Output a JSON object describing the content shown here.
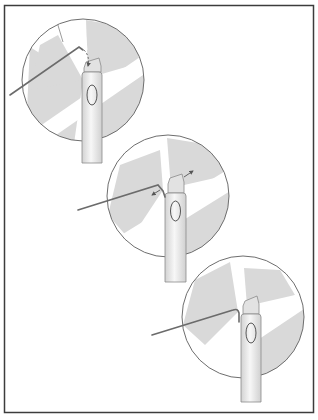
{
  "figure": {
    "width": 318,
    "height": 420,
    "frame": {
      "x": 4.5,
      "y": 5.5,
      "w": 309,
      "h": 407,
      "stroke": "#3c3c3c"
    },
    "colors": {
      "circle_outline": "#6e6e6e",
      "wedge_fill": "#d9d9d9",
      "wire": "#6b6b6b",
      "handle_fill_light": "#f4f4f4",
      "handle_fill_dark": "#d4d4d4",
      "handle_outline": "#8a8a8a",
      "button_outline": "#555555",
      "arrow": "#555555"
    }
  },
  "steps": [
    {
      "id": 1,
      "description": "Hooked wire inserted between the brush head and handle top; dashed arrow indicates movement down into the gap",
      "circle": {
        "cx": 83,
        "cy": 80,
        "r": 61
      },
      "handle": {
        "x": 82,
        "top": 58,
        "w": 21,
        "bottom": 163
      },
      "wire": {
        "start": [
          10,
          95
        ],
        "bend": [
          79,
          47
        ],
        "tip": [
          85,
          57
        ]
      },
      "arrows": [
        "dashed-down"
      ]
    },
    {
      "id": 2,
      "description": "Wire hooked under brush head; double arrows show head pulled apart from handle",
      "circle": {
        "cx": 168,
        "cy": 196,
        "r": 61
      },
      "handle": {
        "x": 165,
        "top": 180,
        "w": 21,
        "bottom": 282
      },
      "wire": {
        "start": [
          78,
          210
        ],
        "bend": [
          158,
          185
        ],
        "tip": [
          163,
          196
        ]
      },
      "arrows": [
        "left",
        "up-right"
      ]
    },
    {
      "id": 3,
      "description": "Brush head removed; wire rests with hook near handle top",
      "circle": {
        "cx": 243,
        "cy": 317,
        "r": 61
      },
      "handle": {
        "x": 241,
        "top": 299,
        "w": 20,
        "bottom": 402
      },
      "wire": {
        "start": [
          152,
          335
        ],
        "bend": [
          236,
          310
        ],
        "tip": [
          239,
          322
        ]
      },
      "arrows": []
    }
  ]
}
